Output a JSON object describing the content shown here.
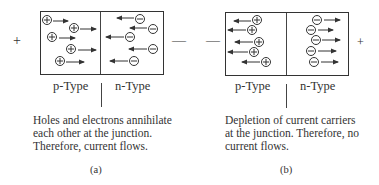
{
  "panels": [
    {
      "id": "a",
      "label": "(a)",
      "left_terminal": "+",
      "right_terminal": "—",
      "p_label": "p-Type",
      "n_label": "n-Type",
      "caption_lines": [
        "Holes and electrons annihilate",
        "each other at the junction.",
        "Therefore, current flows."
      ],
      "holes": {
        "symbol": "+",
        "direction": "toward-junction",
        "count": 5
      },
      "electrons": {
        "symbol": "−",
        "direction": "toward-junction",
        "count": 5
      }
    },
    {
      "id": "b",
      "label": "(b)",
      "left_terminal": "—",
      "right_terminal": "+",
      "p_label": "p-Type",
      "n_label": "n-Type",
      "caption_lines": [
        "Depletion of current carriers",
        "at the junction. Therefore, no",
        "current flows."
      ],
      "holes": {
        "symbol": "+",
        "direction": "away-from-junction",
        "count": 5
      },
      "electrons": {
        "symbol": "−",
        "direction": "away-from-junction",
        "count": 5
      }
    }
  ],
  "colors": {
    "stroke": "#333333",
    "background": "#ffffff"
  }
}
